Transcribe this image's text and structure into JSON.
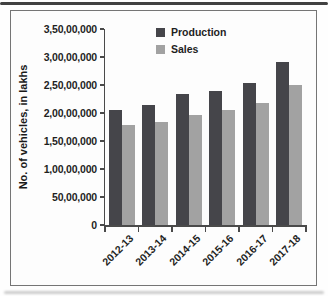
{
  "chart_data": {
    "type": "bar",
    "title": "",
    "ylabel": "No. of vehicles, in lakhs",
    "xlabel": "",
    "categories": [
      "2012-13",
      "2013-14",
      "2014-15",
      "2015-16",
      "2016-17",
      "2017-18"
    ],
    "series": [
      {
        "name": "Production",
        "color": "#45454a",
        "values": [
          20600000,
          21500000,
          23400000,
          24000000,
          25300000,
          29100000
        ]
      },
      {
        "name": "Sales",
        "color": "#a2a2a2",
        "values": [
          17900000,
          18400000,
          19700000,
          20500000,
          21800000,
          25000000
        ]
      }
    ],
    "ylim": [
      0,
      35000000
    ],
    "ytick_step": 5000000,
    "ytick_labels": [
      "0",
      "50,00,000",
      "1,00,00,000",
      "1,50,00,000",
      "2,00,00,000",
      "2,50,00,000",
      "3,00,00,000",
      "3,50,00,000"
    ],
    "legend_position": "top-center",
    "grid": false,
    "axis_color": "#4a4a4a",
    "frame_border_color": "#757575"
  }
}
